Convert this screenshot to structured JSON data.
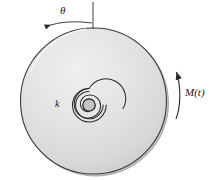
{
  "figure": {
    "type": "engineering-schematic",
    "canvas": {
      "width": 211,
      "height": 180,
      "background": "#ffffff"
    },
    "disc": {
      "name": "shaded-disc",
      "center_x": 93.5,
      "center_y": 101,
      "radius": 73,
      "fill_light": "#e8e8e8",
      "fill_dark": "#c9c9c9",
      "stroke": "#3a3a3a"
    },
    "spring": {
      "name": "spiral-torsion-spring",
      "center_x": 89,
      "center_y": 105,
      "hub_radius": 6,
      "outer_radius": 17,
      "turns": 3,
      "stroke": "#2b2b2b",
      "label": "k"
    },
    "angle": {
      "name": "angular-displacement",
      "label": "θ",
      "reference_line_x": 93,
      "reference_line_top": 2,
      "reference_line_bottom": 29,
      "arrow_direction": "counterclockwise",
      "stroke": "#2b2b2b"
    },
    "moment": {
      "name": "applied-moment",
      "label": "M(t)",
      "arrow_direction": "upward-counterclockwise",
      "arc_x": 177,
      "arc_top": 70,
      "arc_bottom": 119,
      "stroke": "#2b2b2b"
    }
  }
}
